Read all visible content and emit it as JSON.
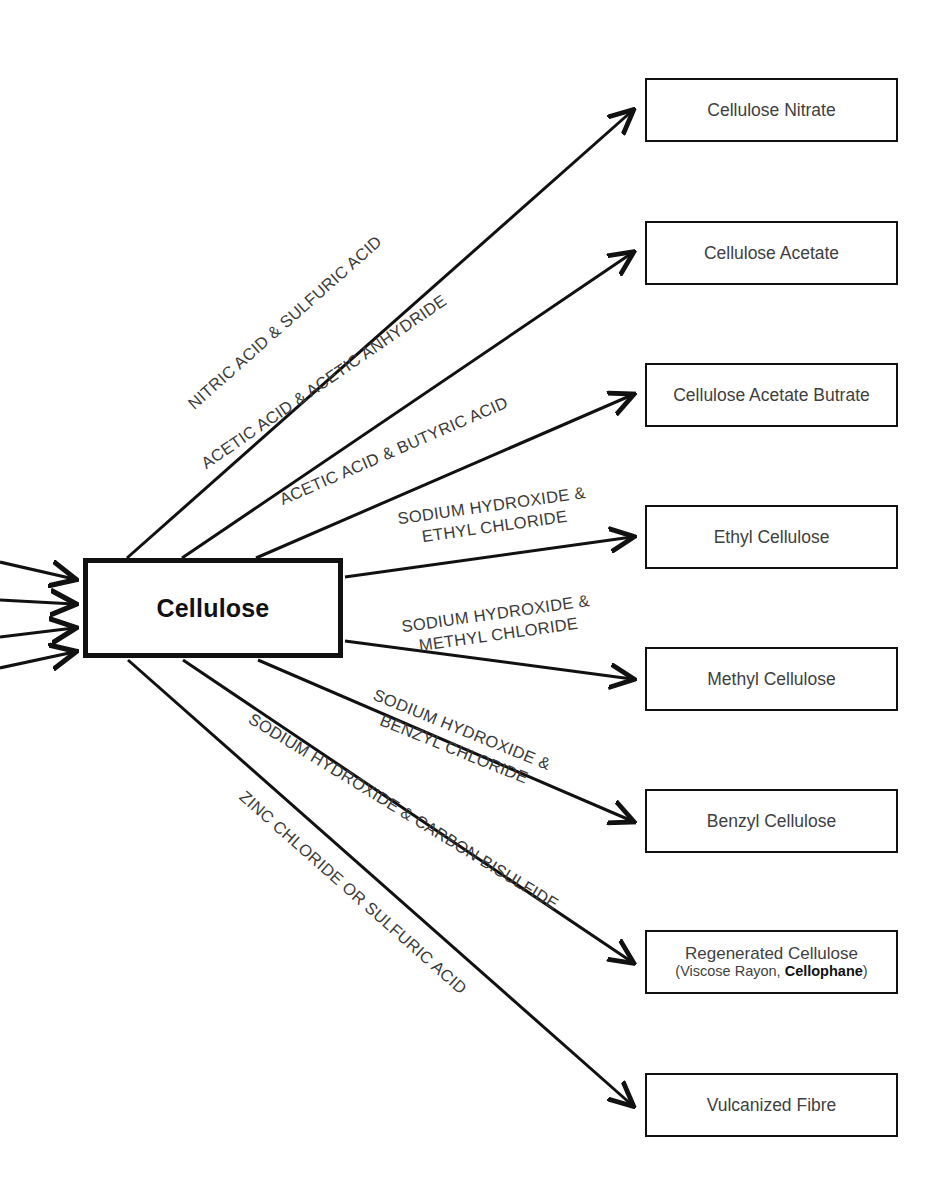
{
  "diagram": {
    "source_node": {
      "label": "Cellulose"
    },
    "inputs": [
      {
        "name": "input-arrow-1"
      },
      {
        "name": "input-arrow-2"
      },
      {
        "name": "input-arrow-3"
      },
      {
        "name": "input-arrow-4"
      }
    ],
    "branches": [
      {
        "reagent": "NITRIC ACID & SULFURIC ACID",
        "reagent_lines": [
          "NITRIC ACID & SULFURIC ACID"
        ],
        "product": "Cellulose Nitrate",
        "product_sub": ""
      },
      {
        "reagent": "ACETIC ACID & ACETIC ANHYDRIDE",
        "reagent_lines": [
          "ACETIC ACID & ACETIC ANHYDRIDE"
        ],
        "product": "Cellulose Acetate",
        "product_sub": ""
      },
      {
        "reagent": "ACETIC ACID & BUTYRIC ACID",
        "reagent_lines": [
          "ACETIC ACID & BUTYRIC ACID"
        ],
        "product": "Cellulose Acetate Butrate",
        "product_sub": ""
      },
      {
        "reagent": "SODIUM HYDROXIDE & ETHYL CHLORIDE",
        "reagent_lines": [
          "SODIUM HYDROXIDE &",
          "ETHYL CHLORIDE"
        ],
        "product": "Ethyl Cellulose",
        "product_sub": ""
      },
      {
        "reagent": "SODIUM HYDROXIDE & METHYL CHLORIDE",
        "reagent_lines": [
          "SODIUM HYDROXIDE &",
          "METHYL CHLORIDE"
        ],
        "product": "Methyl Cellulose",
        "product_sub": ""
      },
      {
        "reagent": "SODIUM HYDROXIDE & BENZYL CHLORIDE",
        "reagent_lines": [
          "SODIUM HYDROXIDE &",
          "BENZYL CHLORIDE"
        ],
        "product": "Benzyl Cellulose",
        "product_sub": ""
      },
      {
        "reagent": "SODIUM HYDROXIDE & CARBON BISULFIDE",
        "reagent_lines": [
          "SODIUM HYDROXIDE & CARBON BISULFIDE"
        ],
        "product": "Regenerated Cellulose",
        "product_sub_prefix": "(Viscose Rayon, ",
        "product_sub_bold": "Cellophane",
        "product_sub_suffix": ")"
      },
      {
        "reagent": "ZINC CHLORIDE OR SULFURIC ACID",
        "reagent_lines": [
          "ZINC CHLORIDE OR SULFURIC ACID"
        ],
        "product": "Vulcanized Fibre",
        "product_sub": ""
      }
    ],
    "colors": {
      "stroke": "#111111",
      "product_text": "#3f3f3f",
      "reagent_text": "#3a3a3a",
      "background": "#ffffff"
    }
  }
}
